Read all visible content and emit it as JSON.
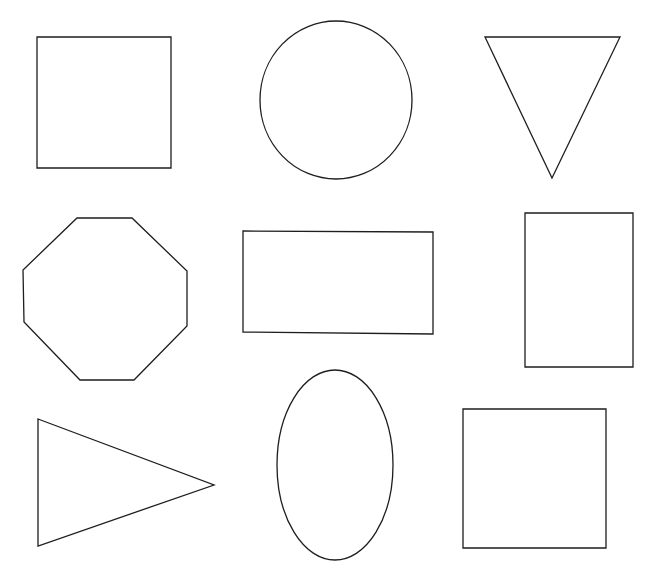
{
  "canvas": {
    "width": 659,
    "height": 576,
    "background": "#ffffff",
    "stroke_color": "#1e1e1e",
    "fill_color": "#ffffff"
  },
  "shapes": [
    {
      "id": "square-top-left",
      "type": "square",
      "kind": "polygon",
      "points": "37,37 171,37 171,168 37,168"
    },
    {
      "id": "circle-top-center",
      "type": "circle",
      "kind": "ellipse",
      "cx": 336,
      "cy": 100,
      "rx": 76,
      "ry": 79
    },
    {
      "id": "triangle-down-top-right",
      "type": "inverted-triangle",
      "kind": "polygon",
      "points": "485,37 620,37 552,178"
    },
    {
      "id": "octagon-middle-left",
      "type": "octagon",
      "kind": "polygon",
      "points": "77,218 132,218 187,271 187,326 134,380 80,380 24,322 23,270"
    },
    {
      "id": "rectangle-middle-center",
      "type": "rectangle",
      "kind": "polygon",
      "points": "243,231 433,232 433,334 243,332"
    },
    {
      "id": "rectangle-tall-middle-right",
      "type": "tall-rectangle",
      "kind": "polygon",
      "points": "525,213 633,213 633,367 525,367"
    },
    {
      "id": "triangle-right-bottom-left",
      "type": "right-pointing-triangle",
      "kind": "polygon",
      "points": "38,419 214,485 38,546"
    },
    {
      "id": "ellipse-bottom-center",
      "type": "ellipse",
      "kind": "ellipse",
      "cx": 335,
      "cy": 465,
      "rx": 58,
      "ry": 95
    },
    {
      "id": "square-bottom-right",
      "type": "square",
      "kind": "polygon",
      "points": "463,409 606,409 606,548 463,548"
    }
  ]
}
